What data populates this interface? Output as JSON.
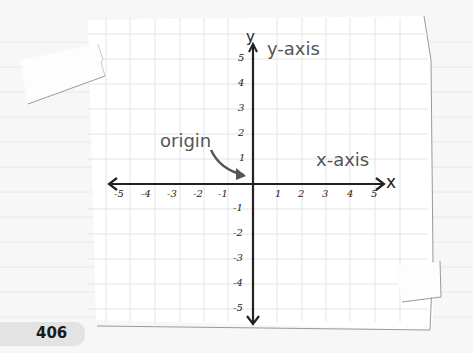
{
  "page": {
    "number": "406"
  },
  "diagram": {
    "axis_labels": {
      "x": "x",
      "y": "y"
    },
    "annotations": {
      "y_axis": "y-axis",
      "x_axis": "x-axis",
      "origin": "origin"
    },
    "x_ticks": [
      "-5",
      "-4",
      "-3",
      "-2",
      "-1",
      "1",
      "2",
      "3",
      "4",
      "5"
    ],
    "y_ticks": [
      "5",
      "4",
      "3",
      "2",
      "1",
      "-1",
      "-2",
      "-3",
      "-4",
      "-5"
    ],
    "range": {
      "x": [
        -5,
        5
      ],
      "y": [
        -5,
        5
      ]
    },
    "colors": {
      "axis": "#222222",
      "annotation": "#555555",
      "grid": "#e4e4e4",
      "paper": "#ffffff",
      "background": "#f7f7f7"
    }
  }
}
